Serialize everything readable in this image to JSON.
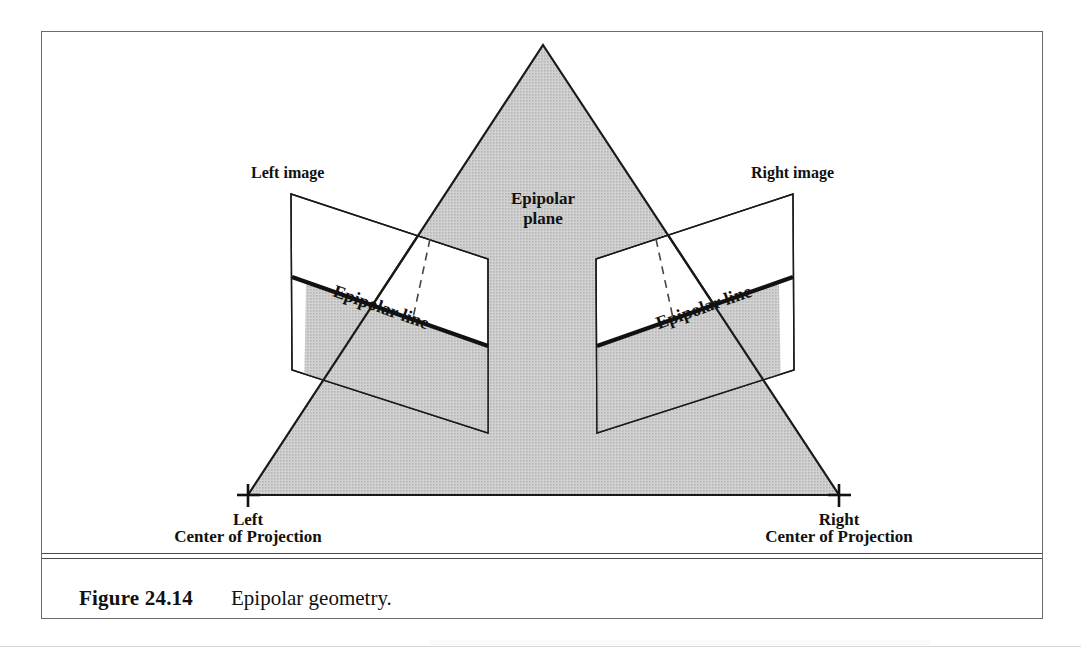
{
  "figure": {
    "caption_number": "Figure 24.14",
    "caption_text": "Epipolar geometry.",
    "labels": {
      "left_image": "Left image",
      "right_image": "Right image",
      "epipolar_plane_line1": "Epipolar",
      "epipolar_plane_line2": "plane",
      "epipolar_line_left": "Epipolar line",
      "epipolar_line_right": "Epipolar line",
      "left_cop_line1": "Left",
      "left_cop_line2": "Center of Projection",
      "right_cop_line1": "Right",
      "right_cop_line2": "Center of Projection"
    },
    "colors": {
      "plane_fill": "#c9c9c9",
      "stroke": "#1a1a1a",
      "border": "#6b6b6b",
      "text": "#111111",
      "page_background": "#ffffff"
    },
    "geometry": {
      "triangle_apex": [
        542,
        44
      ],
      "left_center_of_projection": [
        247,
        494
      ],
      "right_center_of_projection": [
        838,
        494
      ],
      "left_image_plane": [
        [
          290,
          193
        ],
        [
          487,
          258
        ],
        [
          487,
          432
        ],
        [
          291,
          369
        ]
      ],
      "right_image_plane": [
        [
          595,
          258
        ],
        [
          792,
          193
        ],
        [
          793,
          369
        ],
        [
          596,
          432
        ]
      ],
      "left_epipolar_line": [
        [
          291,
          276
        ],
        [
          487,
          345
        ]
      ],
      "right_epipolar_line": [
        [
          596,
          345
        ],
        [
          792,
          276
        ]
      ],
      "left_dashed_ray": [
        [
          429,
          238
        ],
        [
          412,
          317
        ]
      ],
      "right_dashed_ray": [
        [
          655,
          238
        ],
        [
          672,
          317
        ]
      ]
    }
  }
}
